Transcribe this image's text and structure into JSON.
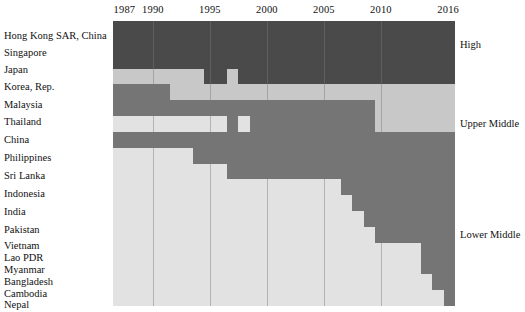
{
  "figure": {
    "type": "heatmap",
    "title": "",
    "xlabel": "",
    "ylabel": ""
  },
  "axis": {
    "year_ticks": [
      {
        "label": "1987",
        "year": 1987
      },
      {
        "label": "1990",
        "year": 1990
      },
      {
        "label": "1995",
        "year": 1995
      },
      {
        "label": "2000",
        "year": 2000
      },
      {
        "label": "2005",
        "year": 2005
      },
      {
        "label": "2010",
        "year": 2010
      },
      {
        "label": "2016",
        "year": 2016
      }
    ],
    "gridline_years": [
      1990,
      1995,
      2000,
      2005,
      2010
    ],
    "year_start": 1987,
    "year_end": 2016
  },
  "categories": [
    {
      "key": "high",
      "label": "High",
      "color": "#4a4a4a"
    },
    {
      "key": "upper_middle",
      "label": "Upper Middle",
      "color": "#c8c8c8"
    },
    {
      "key": "lower_middle",
      "label": "Lower Middle",
      "color": "#757575"
    },
    {
      "key": "low",
      "label": "Low",
      "color": "#e2e2e2"
    }
  ],
  "legend": {
    "position": "right",
    "items": [
      {
        "label": "High",
        "row": 1
      },
      {
        "label": "Upper Middle",
        "row": 6
      },
      {
        "label": "Lower Middle",
        "row": 13
      },
      {
        "label": "Low",
        "row": 19
      }
    ]
  },
  "countries": [
    "Hong Kong SAR, China",
    "Singapore",
    "Japan",
    "Korea, Rep.",
    "Malaysia",
    "Thailand",
    "China",
    "Philippines",
    "Sri Lanka",
    "Indonesia",
    "India",
    "Pakistan",
    "Vietnam",
    "Lao PDR",
    "Myanmar",
    "Bangladesh",
    "Cambodia",
    "Nepal"
  ],
  "chart_data": {
    "type": "heatmap",
    "title": "",
    "xlabel": "",
    "ylabel": "",
    "x": [
      1987,
      1988,
      1989,
      1990,
      1991,
      1992,
      1993,
      1994,
      1995,
      1996,
      1997,
      1998,
      1999,
      2000,
      2001,
      2002,
      2003,
      2004,
      2005,
      2006,
      2007,
      2008,
      2009,
      2010,
      2011,
      2012,
      2013,
      2014,
      2015,
      2016
    ],
    "y": [
      "Hong Kong SAR, China",
      "Singapore",
      "Japan",
      "Korea, Rep.",
      "Malaysia",
      "Thailand",
      "China",
      "Philippines",
      "Sri Lanka",
      "Indonesia",
      "India",
      "Pakistan",
      "Vietnam",
      "Lao PDR",
      "Myanmar",
      "Bangladesh",
      "Cambodia",
      "Nepal"
    ],
    "value_levels": [
      "High",
      "Upper Middle",
      "Lower Middle",
      "Low"
    ],
    "legend_position": "right",
    "grid": true,
    "rows": [
      {
        "country": "Hong Kong SAR, China",
        "segments": [
          {
            "level": "High",
            "from": 1987,
            "to": 2016
          }
        ]
      },
      {
        "country": "Singapore",
        "segments": [
          {
            "level": "High",
            "from": 1987,
            "to": 2016
          }
        ]
      },
      {
        "country": "Japan",
        "segments": [
          {
            "level": "High",
            "from": 1987,
            "to": 2016
          }
        ]
      },
      {
        "country": "Korea, Rep.",
        "segments": [
          {
            "level": "Upper Middle",
            "from": 1987,
            "to": 1994
          },
          {
            "level": "High",
            "from": 1995,
            "to": 1996
          },
          {
            "level": "Upper Middle",
            "from": 1997,
            "to": 1997
          },
          {
            "level": "High",
            "from": 1998,
            "to": 2016
          }
        ]
      },
      {
        "country": "Malaysia",
        "segments": [
          {
            "level": "Lower Middle",
            "from": 1987,
            "to": 1991
          },
          {
            "level": "Upper Middle",
            "from": 1992,
            "to": 2016
          }
        ]
      },
      {
        "country": "Thailand",
        "segments": [
          {
            "level": "Lower Middle",
            "from": 1987,
            "to": 2009
          },
          {
            "level": "Upper Middle",
            "from": 2010,
            "to": 2016
          }
        ]
      },
      {
        "country": "China",
        "segments": [
          {
            "level": "Low",
            "from": 1987,
            "to": 1996
          },
          {
            "level": "Lower Middle",
            "from": 1997,
            "to": 1997
          },
          {
            "level": "Low",
            "from": 1998,
            "to": 1998
          },
          {
            "level": "Lower Middle",
            "from": 1999,
            "to": 2009
          },
          {
            "level": "Upper Middle",
            "from": 2010,
            "to": 2016
          }
        ]
      },
      {
        "country": "Philippines",
        "segments": [
          {
            "level": "Lower Middle",
            "from": 1987,
            "to": 2016
          }
        ]
      },
      {
        "country": "Sri Lanka",
        "segments": [
          {
            "level": "Low",
            "from": 1987,
            "to": 1993
          },
          {
            "level": "Lower Middle",
            "from": 1994,
            "to": 2016
          }
        ]
      },
      {
        "country": "Indonesia",
        "segments": [
          {
            "level": "Low",
            "from": 1987,
            "to": 1996
          },
          {
            "level": "Lower Middle",
            "from": 1997,
            "to": 2016
          }
        ]
      },
      {
        "country": "India",
        "segments": [
          {
            "level": "Low",
            "from": 1987,
            "to": 2006
          },
          {
            "level": "Lower Middle",
            "from": 2007,
            "to": 2016
          }
        ]
      },
      {
        "country": "Pakistan",
        "segments": [
          {
            "level": "Low",
            "from": 1987,
            "to": 2007
          },
          {
            "level": "Lower Middle",
            "from": 2008,
            "to": 2016
          }
        ]
      },
      {
        "country": "Vietnam",
        "segments": [
          {
            "level": "Low",
            "from": 1987,
            "to": 2008
          },
          {
            "level": "Lower Middle",
            "from": 2009,
            "to": 2016
          }
        ]
      },
      {
        "country": "Lao PDR",
        "segments": [
          {
            "level": "Low",
            "from": 1987,
            "to": 2009
          },
          {
            "level": "Lower Middle",
            "from": 2010,
            "to": 2016
          }
        ]
      },
      {
        "country": "Myanmar",
        "segments": [
          {
            "level": "Low",
            "from": 1987,
            "to": 2013
          },
          {
            "level": "Lower Middle",
            "from": 2014,
            "to": 2016
          }
        ]
      },
      {
        "country": "Bangladesh",
        "segments": [
          {
            "level": "Low",
            "from": 1987,
            "to": 2013
          },
          {
            "level": "Lower Middle",
            "from": 2014,
            "to": 2016
          }
        ]
      },
      {
        "country": "Cambodia",
        "segments": [
          {
            "level": "Low",
            "from": 1987,
            "to": 2014
          },
          {
            "level": "Lower Middle",
            "from": 2015,
            "to": 2016
          }
        ]
      },
      {
        "country": "Nepal",
        "segments": [
          {
            "level": "Low",
            "from": 1987,
            "to": 2015
          },
          {
            "level": "Lower Middle",
            "from": 2016,
            "to": 2016
          }
        ]
      }
    ]
  },
  "label_layout": {
    "note": "vertical pixel centers of each country label row",
    "tops": [
      30,
      47,
      64,
      81,
      99,
      116,
      134,
      152,
      170,
      188,
      206,
      224,
      240,
      252,
      264,
      276,
      288,
      299
    ]
  }
}
